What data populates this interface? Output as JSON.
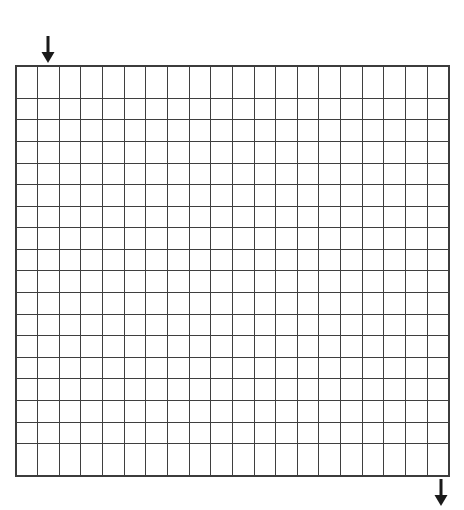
{
  "page": {
    "background_color": "#ffffff",
    "width": 464,
    "height": 510
  },
  "grid": {
    "name": "blank-grid",
    "columns": 20,
    "rows": 18,
    "cell_width_px": 21.75,
    "cell_height_px": 22.9,
    "left_px": 15,
    "top_px": 65,
    "width_px": 435,
    "height_px": 412,
    "line_color": "#3f3f3f",
    "border_color": "#3c3c3c",
    "cell_fill": "#ffffff",
    "cells": []
  },
  "markers": [
    {
      "name": "top-start-arrow",
      "icon": "arrow-down-icon",
      "direction": "down",
      "color": "#1a1a1a",
      "x_px": 48,
      "y_px": 36,
      "target_column": 2,
      "target_row": 1,
      "position_label": "top"
    },
    {
      "name": "bottom-end-arrow",
      "icon": "arrow-down-icon",
      "direction": "down",
      "color": "#1a1a1a",
      "x_px": 441,
      "y_px": 479,
      "target_column": 20,
      "target_row": 18,
      "position_label": "bottom"
    }
  ]
}
